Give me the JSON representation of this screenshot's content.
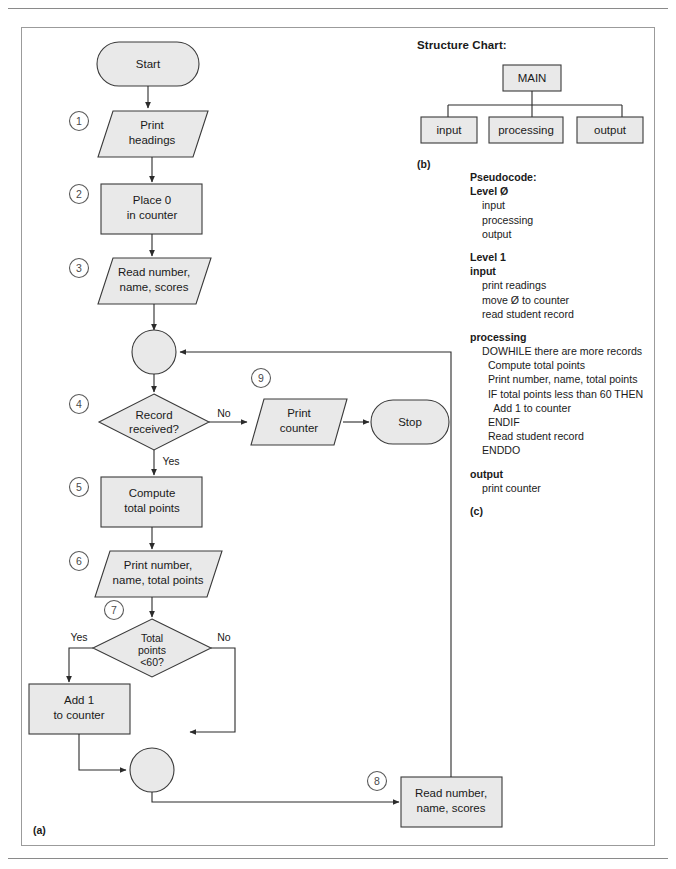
{
  "figure": {
    "caption_a": "(a)",
    "caption_b": "(b)",
    "caption_c": "(c)"
  },
  "colors": {
    "shape_fill": "#e9e9e9",
    "shape_stroke": "#3a3a3a",
    "line": "#2b2b2b",
    "frame": "#9b9b9b"
  },
  "flowchart": {
    "nodes": {
      "start": "Start",
      "print_headings": "Print\nheadings",
      "place_zero": "Place 0\nin counter",
      "read_record_1": "Read number,\nname, scores",
      "record_received": "Record\nreceived?",
      "print_counter": "Print\ncounter",
      "stop": "Stop",
      "compute_total": "Compute\ntotal points",
      "print_totals": "Print number,\nname, total points",
      "total_points_lt60": "Total\npoints\n<60?",
      "add_one": "Add 1\nto counter",
      "read_record_2": "Read number,\nname, scores"
    },
    "step_numbers": [
      "1",
      "2",
      "3",
      "4",
      "5",
      "6",
      "7",
      "8",
      "9"
    ],
    "edge_labels": {
      "decision4_no": "No",
      "decision4_yes": "Yes",
      "decision7_yes": "Yes",
      "decision7_no": "No"
    }
  },
  "structure_chart": {
    "title": "Structure Chart:",
    "root": "MAIN",
    "children": [
      "input",
      "processing",
      "output"
    ]
  },
  "pseudocode": {
    "title": "Pseudocode:",
    "blocks": [
      {
        "heading": "Level Ø",
        "lines": [
          "input",
          "processing",
          "output"
        ]
      },
      {
        "heading": "Level 1",
        "subheading": "input",
        "lines": [
          "print readings",
          "move Ø to counter",
          "read student record"
        ]
      },
      {
        "subheading": "processing",
        "lines": [
          "DOWHILE there are more records",
          "  Compute total points",
          "  Print number, name, total points",
          "  IF total points less than 60 THEN",
          "    Add 1 to counter",
          "  ENDIF",
          "  Read student record",
          "ENDDO"
        ]
      },
      {
        "subheading": "output",
        "lines": [
          "print counter"
        ]
      }
    ]
  }
}
